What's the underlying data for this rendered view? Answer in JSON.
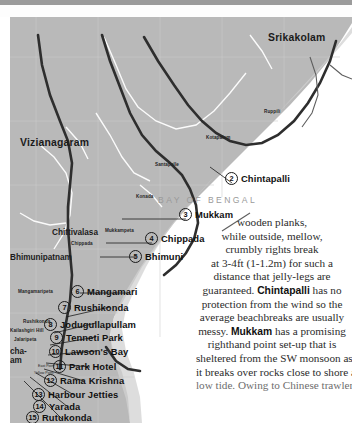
{
  "page": {
    "sea_label": "BAY OF BENGAL"
  },
  "map": {
    "cities": [
      {
        "name": "Srikakolam",
        "size": "big"
      },
      {
        "name": "Vizianagaram",
        "size": "big"
      },
      {
        "name": "Chittivalasa",
        "size": "mid"
      },
      {
        "name": "Bhimunipatnam",
        "size": "mid"
      },
      {
        "name": "cha-",
        "size": "mid"
      },
      {
        "name": "am",
        "size": "mid"
      }
    ],
    "villages": [
      {
        "name": "Ruppili"
      },
      {
        "name": "Kotapalem"
      },
      {
        "name": "Santapalle"
      },
      {
        "name": "Konada"
      },
      {
        "name": "Mukkampeta"
      },
      {
        "name": "Chippada"
      },
      {
        "name": "Mangamaripeta"
      },
      {
        "name": "Rushikonda"
      },
      {
        "name": "Kailashgiri Hill"
      },
      {
        "name": "Jalaripeta"
      }
    ],
    "points": [
      {
        "name": "East Point"
      },
      {
        "name": "Yellow Point"
      }
    ]
  },
  "callouts": [
    {
      "num": "2",
      "label": "Chintapalli"
    },
    {
      "num": "3",
      "label": "Mukkam"
    },
    {
      "num": "4",
      "label": "Chippada"
    },
    {
      "num": "5",
      "label": "Bhimuni"
    },
    {
      "num": "6",
      "label": "Mangamari"
    },
    {
      "num": "7",
      "label": "Rushikonda"
    },
    {
      "num": "8",
      "label": "Jodugullapullam"
    },
    {
      "num": "9",
      "label": "Tenneti Park"
    },
    {
      "num": "10",
      "label": "Lawson's Bay"
    },
    {
      "num": "11",
      "label": "Park Hotel"
    },
    {
      "num": "12",
      "label": "Rama Krishna"
    },
    {
      "num": "13",
      "label": "Harbour Jetties"
    },
    {
      "num": "14",
      "label": "Yarada"
    },
    {
      "num": "15",
      "label": "Rutukonda"
    }
  ],
  "article": {
    "lines": [
      "wooden planks,",
      "while outside, mellow,",
      "crumbly rights break",
      "at 3-4ft (1-1.2m) for such a",
      "distance that jelly-legs are"
    ],
    "l6_a": "guaranteed. ",
    "l6_b": "Chintapalli",
    "l6_c": " has no",
    "l7": "protection from the wind so the",
    "l8": "average beachbreaks are usually",
    "l9_a": "messy. ",
    "l9_b": "Mukkam",
    "l9_c": " has a promising",
    "l10": "righthand point set-up that is",
    "l11": "sheltered from the SW monsoon as",
    "l12": "it breaks over rocks close to shore at",
    "l13": "low tide. Owing to Chinese trawlers, the"
  }
}
